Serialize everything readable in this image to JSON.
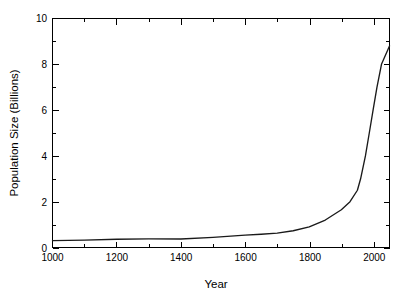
{
  "chart_data": {
    "type": "line",
    "title": "",
    "title_visible": false,
    "title_note": "cut off at top edge of image, illegible",
    "xlabel": "Year",
    "ylabel": "Population Size (Billions)",
    "xlim": [
      1000,
      2050
    ],
    "ylim": [
      0,
      10
    ],
    "x_major_ticks": [
      1000,
      1200,
      1400,
      1600,
      1800,
      2000
    ],
    "x_major_tick_labels": [
      "1000",
      "1200",
      "1400",
      "1600",
      "1800",
      "2000"
    ],
    "x_minor_ticks": [
      1100,
      1300,
      1500,
      1700,
      1900
    ],
    "y_major_ticks": [
      0,
      2,
      4,
      6,
      8,
      10
    ],
    "y_major_tick_labels": [
      "0",
      "2",
      "4",
      "6",
      "8",
      "10"
    ],
    "y_minor_ticks": [
      1,
      3,
      5,
      7,
      9
    ],
    "grid": false,
    "legend": false,
    "legend_position": "none",
    "line_color": "#1a1a1a",
    "background_color": "#ffffff",
    "frame": true,
    "series": [
      {
        "name": "World population",
        "x": [
          1000,
          1100,
          1200,
          1300,
          1400,
          1500,
          1600,
          1650,
          1700,
          1750,
          1800,
          1850,
          1900,
          1927,
          1950,
          1960,
          1975,
          1987,
          2000,
          2011,
          2025,
          2050
        ],
        "values": [
          0.3,
          0.32,
          0.36,
          0.38,
          0.37,
          0.44,
          0.54,
          0.58,
          0.63,
          0.73,
          0.9,
          1.2,
          1.65,
          2.0,
          2.5,
          3.0,
          4.0,
          5.0,
          6.1,
          7.0,
          8.0,
          8.8
        ]
      }
    ]
  },
  "axes": {
    "x_title": "Year",
    "y_title": "Population Size (Billions)"
  }
}
